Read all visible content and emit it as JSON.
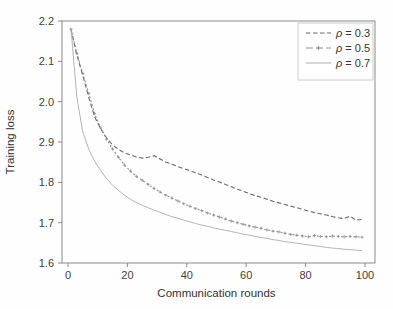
{
  "figure": {
    "background": "#fefefe"
  },
  "chart_data": {
    "type": "line",
    "title": "",
    "xlabel": "Communication rounds",
    "ylabel": "Training loss",
    "xlim": [
      -2,
      103.5
    ],
    "ylim": [
      1.6,
      2.2
    ],
    "grid": false,
    "legend_position": "upper right",
    "axis_color": "#8a8a8a",
    "tick_label_color": "#3f3f3f",
    "axis_title_color": "#333333",
    "legend_border_color": "#cccccc",
    "legend_background": "#ffffff",
    "x_ticks": {
      "values": [
        0,
        20,
        40,
        60,
        80,
        100
      ],
      "labels": [
        "0",
        "20",
        "40",
        "60",
        "80",
        "100"
      ]
    },
    "y_ticks": {
      "values": [
        2.2,
        2.1,
        2.0,
        1.9,
        1.8,
        1.7,
        1.6
      ],
      "labels": [
        "2.2",
        "2.1",
        "2.0",
        "2.9",
        "1.8",
        "1.7",
        "1.6"
      ]
    },
    "x": [
      1,
      3,
      5,
      7,
      9,
      11,
      13,
      15,
      17,
      19,
      21,
      23,
      25,
      27,
      29,
      31,
      33,
      35,
      37,
      39,
      41,
      43,
      45,
      47,
      49,
      51,
      53,
      55,
      57,
      59,
      61,
      63,
      65,
      67,
      69,
      71,
      73,
      75,
      77,
      79,
      81,
      83,
      85,
      87,
      89,
      91,
      93,
      95,
      97,
      99
    ],
    "series": [
      {
        "name": "ρ = 0.3",
        "color": "#6b6b6b",
        "style": "dashed",
        "marker": "none",
        "values": [
          2.18,
          2.115,
          2.065,
          2.01,
          1.962,
          1.933,
          1.91,
          1.893,
          1.882,
          1.873,
          1.868,
          1.863,
          1.86,
          1.862,
          1.866,
          1.858,
          1.85,
          1.845,
          1.839,
          1.834,
          1.829,
          1.824,
          1.818,
          1.812,
          1.806,
          1.801,
          1.795,
          1.789,
          1.783,
          1.778,
          1.772,
          1.767,
          1.763,
          1.758,
          1.753,
          1.749,
          1.745,
          1.741,
          1.737,
          1.733,
          1.729,
          1.725,
          1.722,
          1.719,
          1.715,
          1.712,
          1.71,
          1.716,
          1.706,
          1.708
        ]
      },
      {
        "name": "ρ = 0.5",
        "color": "#909090",
        "style": "dash-dot",
        "marker": "plus",
        "values": [
          2.18,
          2.12,
          2.07,
          2.02,
          1.97,
          1.935,
          1.907,
          1.883,
          1.862,
          1.843,
          1.828,
          1.815,
          1.805,
          1.795,
          1.785,
          1.776,
          1.768,
          1.761,
          1.754,
          1.747,
          1.741,
          1.735,
          1.73,
          1.724,
          1.719,
          1.714,
          1.709,
          1.704,
          1.7,
          1.696,
          1.692,
          1.689,
          1.686,
          1.682,
          1.679,
          1.677,
          1.674,
          1.671,
          1.669,
          1.667,
          1.665,
          1.668,
          1.666,
          1.665,
          1.667,
          1.666,
          1.665,
          1.666,
          1.665,
          1.664
        ]
      },
      {
        "name": "ρ = 0.7",
        "color": "#b4b4b4",
        "style": "solid",
        "marker": "none",
        "values": [
          2.18,
          2.01,
          1.925,
          1.882,
          1.852,
          1.829,
          1.809,
          1.793,
          1.78,
          1.768,
          1.758,
          1.75,
          1.743,
          1.737,
          1.731,
          1.726,
          1.72,
          1.715,
          1.711,
          1.706,
          1.702,
          1.698,
          1.694,
          1.691,
          1.687,
          1.684,
          1.681,
          1.678,
          1.675,
          1.672,
          1.669,
          1.666,
          1.663,
          1.661,
          1.658,
          1.656,
          1.653,
          1.651,
          1.649,
          1.647,
          1.645,
          1.643,
          1.641,
          1.639,
          1.637,
          1.636,
          1.634,
          1.633,
          1.632,
          1.631
        ]
      }
    ]
  }
}
